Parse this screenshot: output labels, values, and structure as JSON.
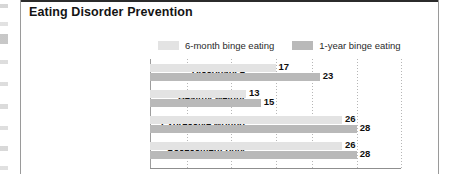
{
  "figure": {
    "title": "Eating Disorder Prevention"
  },
  "legend": {
    "items": [
      {
        "label": "6-month binge eating",
        "color": "#e3e3e3",
        "name": "legend-swatch-six-month"
      },
      {
        "label": "1-year binge eating",
        "color": "#b9b9b9",
        "name": "legend-swatch-one-year"
      }
    ]
  },
  "chart_data": {
    "type": "bar",
    "orientation": "horizontal",
    "title": "Eating Disorder Prevention",
    "xlabel": "",
    "ylabel": "",
    "xlim": [
      0,
      34
    ],
    "grid": true,
    "gridlines": [
      5,
      11,
      17,
      22,
      28,
      34
    ],
    "legend_position": "top",
    "categories": [
      "Dissonance",
      "Healthy weight",
      "Expressive writing",
      "Assessment only"
    ],
    "series": [
      {
        "name": "6-month binge eating",
        "color": "#e3e3e3",
        "values": [
          17,
          13,
          26,
          26
        ]
      },
      {
        "name": "1-year binge eating",
        "color": "#b9b9b9",
        "values": [
          23,
          15,
          28,
          28
        ]
      }
    ]
  }
}
